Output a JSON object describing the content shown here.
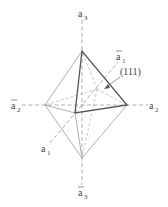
{
  "diagram": {
    "axes": {
      "a3_top": {
        "base": "a",
        "bar": false,
        "sub": "3"
      },
      "a3_bottom": {
        "base": "a",
        "bar": true,
        "sub": "3"
      },
      "a2_left": {
        "base": "a",
        "bar": true,
        "sub": "2"
      },
      "a2_right": {
        "base": "a",
        "bar": false,
        "sub": "2"
      },
      "a1_front": {
        "base": "a",
        "bar": false,
        "sub": "1"
      },
      "a1_back": {
        "base": "a",
        "bar": true,
        "sub": "1"
      }
    },
    "face_label": "(111)",
    "colors": {
      "edges": "#9a9a9a",
      "highlighted_face": "#555555",
      "text": "#444444"
    }
  }
}
